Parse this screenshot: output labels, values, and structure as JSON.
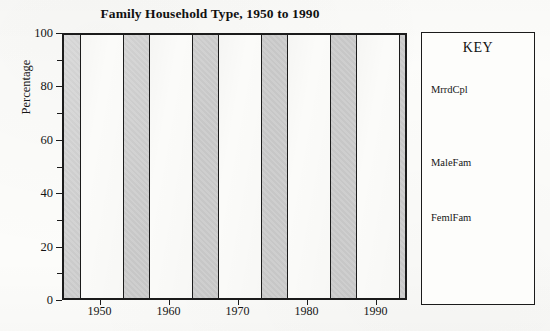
{
  "chart_data": {
    "type": "bar",
    "title": "Family Household Type, 1950 to 1990",
    "xlabel": "",
    "ylabel": "Percentage",
    "categories": [
      "1950",
      "1960",
      "1970",
      "1980",
      "1990"
    ],
    "series": [
      {
        "name": "MrrdCpl",
        "values": [
          100,
          100,
          100,
          100,
          100
        ]
      }
    ],
    "values": [
      100,
      100,
      100,
      100,
      100
    ],
    "ylim": [
      0,
      100
    ],
    "y_major_ticks": [
      "0",
      "20",
      "40",
      "60",
      "80",
      "100"
    ],
    "y_minor_ticks": [
      "10",
      "30",
      "50",
      "70",
      "90"
    ],
    "grid": false,
    "legend_position": "right",
    "legend_entries": [
      "MrrdCpl",
      "MaleFam",
      "FemlFam"
    ],
    "plot_background_color": "#c9c9c9",
    "bar_fill_color": "#fbfbf9",
    "bar_outline_color": "#1b1b1b"
  },
  "key": {
    "title": "KEY",
    "entries": [
      {
        "label": "MrrdCpl"
      },
      {
        "label": "MaleFam"
      },
      {
        "label": "FemlFam"
      }
    ]
  }
}
